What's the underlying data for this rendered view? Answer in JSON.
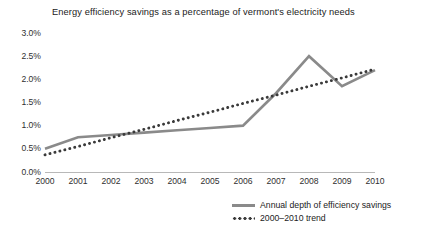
{
  "chart_data": {
    "type": "line",
    "title": "Energy efficiency savings as a percentage of vermont's electricity needs",
    "xlabel": "",
    "ylabel": "",
    "grid": false,
    "legend_position": "bottom-right",
    "categories": [
      "2000",
      "2001",
      "2002",
      "2003",
      "2004",
      "2005",
      "2006",
      "2007",
      "2008",
      "2009",
      "2010"
    ],
    "x": [
      2000,
      2001,
      2002,
      2003,
      2004,
      2005,
      2006,
      2007,
      2008,
      2009,
      2010
    ],
    "ylim": [
      0.0,
      3.0
    ],
    "yticks": [
      0.0,
      0.5,
      1.0,
      1.5,
      2.0,
      2.5,
      3.0
    ],
    "ytick_labels": [
      "0.0%",
      "0.5%",
      "1.0%",
      "1.5%",
      "2.0%",
      "2.5%",
      "3.0%"
    ],
    "series": [
      {
        "name": "Annual depth of efficiency savings",
        "style": "solid",
        "color": "#8a8a8a",
        "values": [
          0.5,
          0.75,
          0.8,
          0.85,
          0.9,
          0.95,
          1.0,
          1.7,
          2.5,
          1.85,
          2.2
        ]
      },
      {
        "name": "2000–2010 trend",
        "style": "dotted",
        "color": "#3a3a3a",
        "values": [
          0.37,
          0.55,
          0.74,
          0.92,
          1.11,
          1.29,
          1.48,
          1.66,
          1.85,
          2.03,
          2.22
        ]
      }
    ]
  },
  "legend": {
    "items": [
      {
        "label": "Annual depth of efficiency savings",
        "style": "solid"
      },
      {
        "label": "2000–2010 trend",
        "style": "dotted"
      }
    ]
  }
}
